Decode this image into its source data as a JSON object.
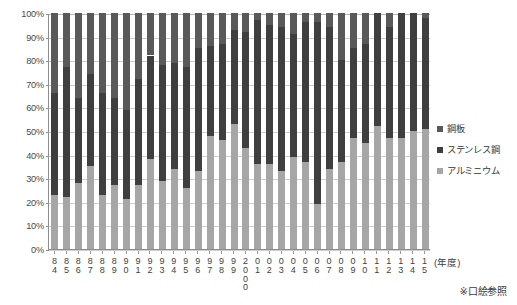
{
  "chart_data": {
    "type": "bar",
    "stacked": true,
    "stack_mode": "percent",
    "title": "",
    "subtitle": "",
    "xlabel": "(年度)",
    "ylabel": "",
    "ylim": [
      0,
      100
    ],
    "y_ticks": [
      "0%",
      "10%",
      "20%",
      "30%",
      "40%",
      "50%",
      "60%",
      "70%",
      "80%",
      "90%",
      "100%"
    ],
    "y_tick_values": [
      0,
      10,
      20,
      30,
      40,
      50,
      60,
      70,
      80,
      90,
      100
    ],
    "grid": true,
    "grid_axis": "y",
    "legend_position": "right",
    "categories": [
      "84",
      "85",
      "86",
      "87",
      "88",
      "89",
      "90",
      "91",
      "92",
      "93",
      "94",
      "95",
      "96",
      "97",
      "98",
      "99",
      "2000",
      "01",
      "02",
      "03",
      "04",
      "05",
      "06",
      "07",
      "08",
      "09",
      "10",
      "11",
      "12",
      "13",
      "14",
      "15"
    ],
    "series": [
      {
        "name": "アルミニウム",
        "color": "#a6a6a6",
        "values": [
          23,
          22,
          28,
          35,
          23,
          27,
          21,
          27,
          38,
          29,
          34,
          26,
          33,
          48,
          46,
          53,
          43,
          36,
          36,
          33,
          39,
          37,
          19,
          34,
          37,
          47,
          45,
          52,
          47,
          47,
          50,
          51
        ]
      },
      {
        "name": "ステンレス鋼",
        "color": "#3f3f3f",
        "values": [
          43,
          55,
          36,
          39,
          43,
          37,
          38,
          45,
          44,
          49,
          45,
          51,
          52,
          38,
          41,
          40,
          49,
          61,
          59,
          61,
          52,
          59,
          77,
          60,
          43,
          38,
          42,
          48,
          47,
          53,
          50,
          47
        ]
      },
      {
        "name": "鋼板",
        "color": "#595959",
        "values": [
          34,
          23,
          36,
          26,
          34,
          36,
          41,
          28,
          18,
          22,
          21,
          23,
          15,
          14,
          13,
          7,
          8,
          3,
          5,
          6,
          9,
          4,
          4,
          6,
          20,
          15,
          13,
          0,
          6,
          0,
          0,
          2
        ]
      }
    ],
    "cumulative_upper_bounds": {
      "aluminium_top": [
        23,
        22,
        28,
        35,
        23,
        27,
        21,
        27,
        38,
        29,
        34,
        26,
        33,
        48,
        46,
        53,
        43,
        36,
        36,
        33,
        39,
        37,
        19,
        34,
        37,
        47,
        45,
        52,
        47,
        47,
        50,
        51
      ],
      "stainless_top": [
        66,
        77,
        64,
        74,
        66,
        64,
        59,
        72,
        82,
        78,
        79,
        77,
        85,
        86,
        87,
        93,
        92,
        97,
        95,
        94,
        91,
        96,
        96,
        94,
        80,
        85,
        87,
        100,
        94,
        100,
        100,
        98
      ]
    }
  },
  "legend": {
    "items": [
      {
        "label": "鋼板",
        "color": "#595959"
      },
      {
        "label": "ステンレス鋼",
        "color": "#3f3f3f"
      },
      {
        "label": "アルミニウム",
        "color": "#a6a6a6"
      }
    ]
  },
  "footnote": "※口絵参照",
  "axis": {
    "x_unit_label": "(年度)"
  }
}
